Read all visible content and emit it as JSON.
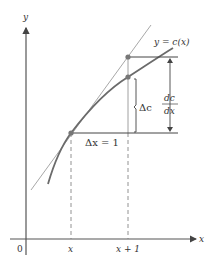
{
  "diagram": {
    "axes": {
      "y_label": "y",
      "x_label": "x",
      "origin_label": "0"
    },
    "ticks": {
      "x_tick": "x",
      "x_plus_1_tick": "x + 1"
    },
    "curve_label": "y = c(x)",
    "delta_x_label": "Δx = 1",
    "delta_c_label": "Δc",
    "derivative_label": {
      "numerator": "dc",
      "denominator": "dx"
    },
    "colors": {
      "axis": "#555555",
      "curve": "#6b6b6b",
      "tangent": "#a8a8a8",
      "point": "#777777",
      "text": "#333333"
    }
  }
}
